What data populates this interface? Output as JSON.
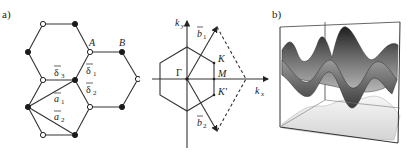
{
  "panel_a": {
    "label": "a)",
    "lattice": {
      "site_A_label": "A",
      "site_B_label": "B",
      "vectors": {
        "delta1": "δ",
        "delta1_sub": "1",
        "delta2": "δ",
        "delta2_sub": "2",
        "delta3": "δ",
        "delta3_sub": "3",
        "a1": "a",
        "a1_sub": "1",
        "a2": "a",
        "a2_sub": "2"
      }
    },
    "brillouin_zone": {
      "ky_label": "k",
      "ky_sub": "y",
      "kx_label": "k",
      "kx_sub": "x",
      "gamma_label": "Γ",
      "M_label": "M",
      "K_label": "K",
      "Kprime_label": "K'",
      "b1": "b",
      "b1_sub": "1",
      "b2": "b",
      "b2_sub": "2"
    }
  },
  "panel_b": {
    "label": "b)",
    "description": "3D band structure surfaces in a wireframe box"
  },
  "colors": {
    "line": "#333333",
    "filled_site": "#1a1a1a",
    "open_site": "#ffffff"
  }
}
